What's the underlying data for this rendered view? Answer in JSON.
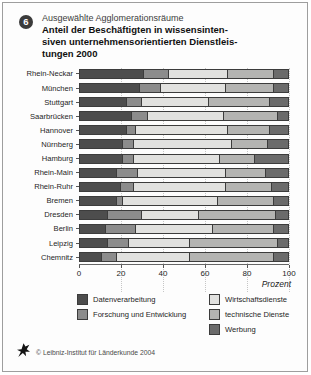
{
  "figure": {
    "badge": "6",
    "kicker": "Ausgewählte Agglomerationsräume",
    "title_lines": [
      "Anteil der Beschäftigten in wissensinten-",
      "siven unternehmensorientierten Dienstleis-",
      "tungen 2000"
    ],
    "footer": "© Leibniz-Institut für Länderkunde 2004"
  },
  "chart_data": {
    "type": "bar",
    "orientation": "horizontal",
    "stacked": true,
    "subtitle": "Ausgewählte Agglomerationsräume",
    "xlabel": "Prozent",
    "xlim": [
      0,
      100
    ],
    "xticks": [
      0,
      20,
      40,
      60,
      80,
      100
    ],
    "grid": "vertical-dotted",
    "legend_position": "bottom-two-columns",
    "categories": [
      "Rhein-Neckar",
      "München",
      "Stuttgart",
      "Saarbrücken",
      "Hannover",
      "Nürnberg",
      "Hamburg",
      "Rhein-Main",
      "Rhein-Ruhr",
      "Bremen",
      "Dresden",
      "Berlin",
      "Leipzig",
      "Chemnitz"
    ],
    "series": [
      {
        "name": "Datenverarbeitung",
        "color": "#4d4d4d",
        "values": [
          31,
          29,
          23,
          25,
          23,
          21,
          21,
          18,
          20,
          18,
          14,
          13,
          14,
          11
        ]
      },
      {
        "name": "Forschung und Entwicklung",
        "color": "#8c8c8c",
        "values": [
          12,
          10,
          7,
          8,
          4,
          5,
          5,
          10,
          6,
          3,
          16,
          14,
          10,
          7
        ]
      },
      {
        "name": "Wirtschaftsdienste",
        "color": "#e1e1df",
        "values": [
          28,
          31,
          32,
          36,
          44,
          47,
          41,
          42,
          44,
          45,
          27,
          37,
          29,
          35
        ]
      },
      {
        "name": "technische Dienste",
        "color": "#b4b4b2",
        "values": [
          22,
          23,
          29,
          26,
          20,
          17,
          17,
          19,
          22,
          27,
          37,
          29,
          42,
          40
        ]
      },
      {
        "name": "Werbung",
        "color": "#6b6b6b",
        "values": [
          7,
          7,
          9,
          5,
          9,
          10,
          16,
          11,
          8,
          7,
          6,
          7,
          5,
          7
        ]
      }
    ],
    "legend_columns": [
      [
        0,
        1
      ],
      [
        2,
        3,
        4
      ]
    ]
  }
}
